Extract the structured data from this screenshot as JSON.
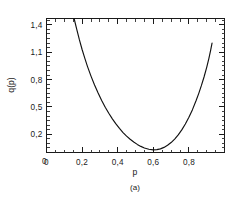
{
  "chart_data": {
    "type": "line",
    "title": "",
    "subtitle": "",
    "caption": "(a)",
    "xlabel": "p",
    "ylabel": "q(p)",
    "xlim": [
      0.0,
      1.0
    ],
    "ylim": [
      0.0,
      1.47
    ],
    "grid": false,
    "legend": null,
    "x_ticklabels": [
      "0",
      "0,2",
      "0,4",
      "0,6",
      "0,8"
    ],
    "x_tickvalues": [
      0.0,
      0.2,
      0.4,
      0.6,
      0.8
    ],
    "x_minor_step": 0.05,
    "y_ticklabels": [
      "0",
      "0,2",
      "0,5",
      "0,8",
      "1,1",
      "1,4"
    ],
    "y_tickvalues": [
      0.0,
      0.2,
      0.5,
      0.8,
      1.1,
      1.4
    ],
    "y_minor_step": 0.05,
    "series": [
      {
        "name": "q(p)",
        "color": "#111111",
        "x": [
          0.155,
          0.17,
          0.185,
          0.2,
          0.215,
          0.23,
          0.25,
          0.27,
          0.29,
          0.31,
          0.33,
          0.35,
          0.37,
          0.39,
          0.41,
          0.43,
          0.45,
          0.47,
          0.49,
          0.51,
          0.53,
          0.55,
          0.575,
          0.6,
          0.62,
          0.64,
          0.66,
          0.68,
          0.7,
          0.72,
          0.74,
          0.76,
          0.78,
          0.8,
          0.82,
          0.84,
          0.855,
          0.87,
          0.885,
          0.9,
          0.912,
          0.922,
          0.93
        ],
        "y": [
          1.47,
          1.35,
          1.235,
          1.13,
          1.035,
          0.945,
          0.838,
          0.741,
          0.652,
          0.571,
          0.497,
          0.43,
          0.369,
          0.314,
          0.264,
          0.219,
          0.18,
          0.145,
          0.115,
          0.089,
          0.067,
          0.05,
          0.036,
          0.029,
          0.031,
          0.04,
          0.056,
          0.079,
          0.109,
          0.147,
          0.193,
          0.248,
          0.312,
          0.386,
          0.47,
          0.567,
          0.646,
          0.733,
          0.828,
          0.934,
          1.03,
          1.12,
          1.2
        ]
      }
    ]
  },
  "axes": {
    "x_label": "p",
    "y_label": "q(p)"
  },
  "figure": {
    "caption_label": "(a)"
  }
}
